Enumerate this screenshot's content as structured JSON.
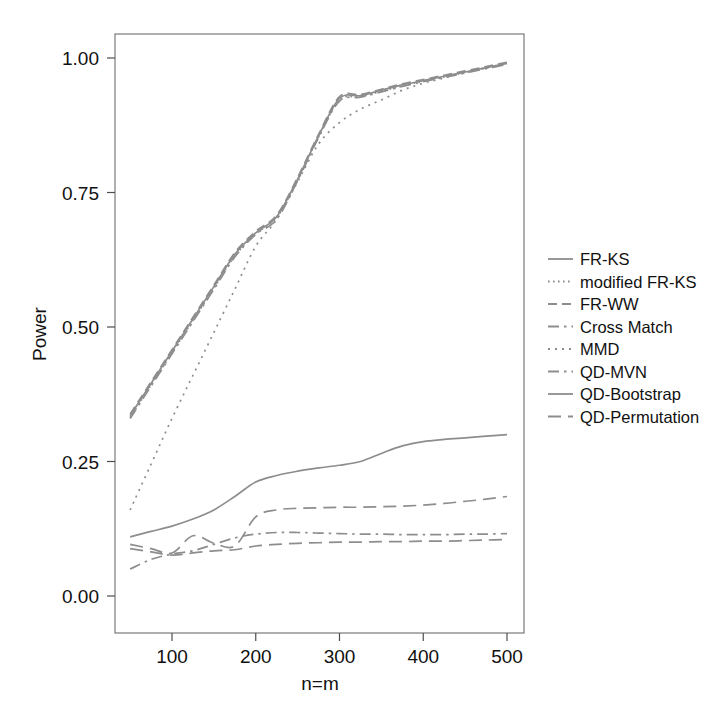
{
  "chart_data": {
    "type": "line",
    "title": "",
    "xlabel": "n=m",
    "ylabel": "Power",
    "xlim": [
      40,
      510
    ],
    "ylim": [
      -0.02,
      1.04
    ],
    "grid": false,
    "legend_position": "right",
    "xticks": [
      100,
      200,
      300,
      400,
      500
    ],
    "xtick_labels": [
      "100",
      "200",
      "300",
      "400",
      "500"
    ],
    "yticks": [
      0.0,
      0.25,
      0.5,
      0.75,
      1.0
    ],
    "ytick_labels": [
      "0.00",
      "0.25",
      "0.50",
      "0.75",
      "1.00"
    ],
    "line_color": "#8d8d8d",
    "x": [
      50,
      75,
      100,
      125,
      150,
      175,
      200,
      225,
      250,
      275,
      300,
      325,
      350,
      375,
      400,
      425,
      450,
      475,
      500
    ],
    "series": [
      {
        "name": "FR-KS",
        "dash": "solid",
        "values": [
          0.335,
          0.395,
          0.455,
          0.515,
          0.575,
          0.635,
          0.675,
          0.705,
          0.775,
          0.855,
          0.925,
          0.93,
          0.94,
          0.95,
          0.958,
          0.966,
          0.974,
          0.982,
          0.99
        ]
      },
      {
        "name": "modified FR-KS",
        "dash": "fine-dotted",
        "values": [
          0.332,
          0.392,
          0.452,
          0.512,
          0.572,
          0.632,
          0.673,
          0.703,
          0.773,
          0.853,
          0.922,
          0.928,
          0.938,
          0.948,
          0.957,
          0.965,
          0.973,
          0.981,
          0.989
        ]
      },
      {
        "name": "FR-WW",
        "dash": "dashed",
        "values": [
          0.338,
          0.398,
          0.458,
          0.518,
          0.578,
          0.638,
          0.678,
          0.708,
          0.778,
          0.858,
          0.928,
          0.932,
          0.942,
          0.952,
          0.96,
          0.968,
          0.976,
          0.984,
          0.992
        ]
      },
      {
        "name": "Cross Match",
        "dash": "dash-dot",
        "values": [
          0.33,
          0.39,
          0.45,
          0.51,
          0.57,
          0.63,
          0.672,
          0.7,
          0.772,
          0.852,
          0.92,
          0.927,
          0.937,
          0.947,
          0.956,
          0.964,
          0.972,
          0.98,
          0.988
        ]
      },
      {
        "name": "MMD",
        "dash": "dotted",
        "values": [
          0.16,
          0.245,
          0.33,
          0.41,
          0.49,
          0.57,
          0.65,
          0.7,
          0.77,
          0.84,
          0.88,
          0.905,
          0.922,
          0.94,
          0.953,
          0.963,
          0.973,
          0.982,
          0.99
        ]
      },
      {
        "name": "QD-MVN",
        "dash": "dash-dot",
        "values": [
          0.05,
          0.068,
          0.078,
          0.084,
          0.096,
          0.108,
          0.115,
          0.118,
          0.118,
          0.117,
          0.116,
          0.115,
          0.115,
          0.114,
          0.114,
          0.114,
          0.115,
          0.115,
          0.116
        ]
      },
      {
        "name": "QD-Bootstrap",
        "dash": "solid",
        "values": [
          0.11,
          0.12,
          0.13,
          0.143,
          0.16,
          0.185,
          0.212,
          0.224,
          0.232,
          0.238,
          0.243,
          0.25,
          0.265,
          0.279,
          0.287,
          0.291,
          0.294,
          0.297,
          0.3
        ]
      },
      {
        "name": "QD-Permutation",
        "dash": "long-dashed",
        "values": [
          0.096,
          0.088,
          0.08,
          0.112,
          0.098,
          0.093,
          0.147,
          0.16,
          0.163,
          0.164,
          0.165,
          0.165,
          0.166,
          0.167,
          0.169,
          0.172,
          0.176,
          0.18,
          0.185
        ]
      },
      {
        "name": "QD-Permutation-low",
        "dash": "long-dashed",
        "values": [
          0.088,
          0.082,
          0.076,
          0.08,
          0.084,
          0.086,
          0.093,
          0.096,
          0.098,
          0.099,
          0.1,
          0.1,
          0.101,
          0.101,
          0.102,
          0.102,
          0.103,
          0.104,
          0.105
        ]
      }
    ]
  },
  "legend": {
    "entries": [
      {
        "label": "FR-KS",
        "dash": "solid"
      },
      {
        "label": "modified FR-KS",
        "dash": "fine-dotted"
      },
      {
        "label": "FR-WW",
        "dash": "dashed"
      },
      {
        "label": "Cross Match",
        "dash": "dash-dot"
      },
      {
        "label": "MMD",
        "dash": "dotted"
      },
      {
        "label": "QD-MVN",
        "dash": "dash-dot"
      },
      {
        "label": "QD-Bootstrap",
        "dash": "solid"
      },
      {
        "label": "QD-Permutation",
        "dash": "long-dashed"
      }
    ]
  }
}
